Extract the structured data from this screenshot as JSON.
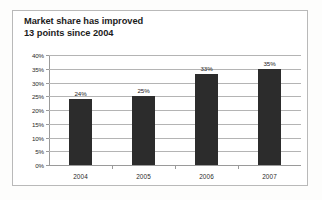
{
  "chart_data": {
    "type": "bar",
    "title": "Market share has improved 13 points since 2004",
    "title_lines": [
      "Market share has improved",
      "13 points since 2004"
    ],
    "xlabel": "",
    "ylabel": "",
    "categories": [
      "2004",
      "2005",
      "2006",
      "2007"
    ],
    "values": [
      24,
      25,
      33,
      35
    ],
    "value_labels": [
      "24%",
      "25%",
      "33%",
      "35%"
    ],
    "ylim": [
      0,
      40
    ],
    "ytick_values": [
      0,
      5,
      10,
      15,
      20,
      25,
      30,
      35,
      40
    ],
    "ytick_labels": [
      "0%",
      "5%",
      "10%",
      "15%",
      "20%",
      "25%",
      "30%",
      "35%",
      "40%"
    ],
    "grid": true,
    "legend": null,
    "series": [
      {
        "name": "Market share",
        "values": [
          24,
          25,
          33,
          35
        ],
        "color": "#2c2c2c"
      }
    ],
    "colors": {
      "bar": "#2c2c2c",
      "gridline": "#b4b4b4",
      "axis": "#9a9a9a",
      "border": "#b9b9b9",
      "text": "#2a2a2a",
      "title": "#1c1c1c",
      "background": "#ffffff"
    }
  }
}
